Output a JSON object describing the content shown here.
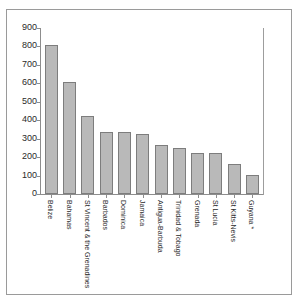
{
  "chart_data": {
    "type": "bar",
    "title": "",
    "subtitle": "",
    "xlabel": "",
    "ylabel": "",
    "ylim": [
      0,
      900
    ],
    "ytick_step": 100,
    "yticks": [
      0,
      100,
      200,
      300,
      400,
      500,
      600,
      700,
      800,
      900
    ],
    "grid": false,
    "legend": "none",
    "orientation": "vertical",
    "bar_color": "#b9b9b9",
    "bar_edge_color": "#7d7d7d",
    "axis_color": "#8d8d8d",
    "text_color": "#2a2a2a",
    "categories": [
      "Belize",
      "Bahamas",
      "St Vincent & the Grenadines",
      "Barbados",
      "Dominica",
      "Jamaica",
      "Antigua-Barbuda",
      "Trinidad & Tobago",
      "Grenada",
      "St Lucia",
      "St Kitts-Nevis",
      "Guyana *"
    ],
    "values": [
      810,
      610,
      425,
      335,
      335,
      325,
      265,
      250,
      225,
      220,
      165,
      105
    ]
  }
}
